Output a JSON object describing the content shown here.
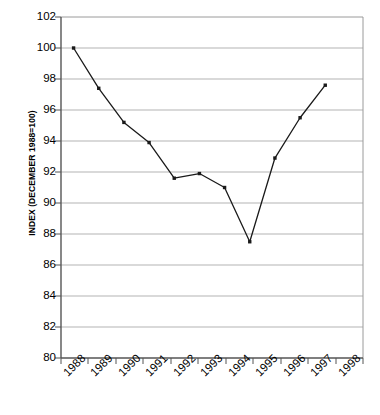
{
  "chart_data": {
    "type": "line",
    "title": "",
    "xlabel": "",
    "ylabel": "INDEX (DECEMBER 1988=100)",
    "categories": [
      "1988",
      "1989",
      "1990",
      "1991",
      "1992",
      "1993",
      "1994",
      "1995",
      "1996",
      "1997",
      "1998"
    ],
    "values": [
      100.0,
      97.4,
      95.2,
      93.9,
      91.6,
      91.9,
      91.0,
      87.5,
      92.9,
      95.5,
      97.6
    ],
    "series": [
      {
        "name": "Index",
        "values": [
          100.0,
          97.4,
          95.2,
          93.9,
          91.6,
          91.9,
          91.0,
          87.5,
          92.9,
          95.5,
          97.6
        ]
      }
    ],
    "ylim": [
      80,
      102
    ],
    "ytick_labels": [
      "80",
      "82",
      "84",
      "86",
      "88",
      "90",
      "92",
      "94",
      "96",
      "98",
      "100",
      "102"
    ],
    "ytick_values": [
      80,
      82,
      84,
      86,
      88,
      90,
      92,
      94,
      96,
      98,
      100,
      102
    ],
    "xtick_labels": [
      "1988",
      "1989",
      "1990",
      "1991",
      "1992",
      "1993",
      "1994",
      "1995",
      "1996",
      "1997",
      "1998"
    ],
    "grid": "horizontal",
    "legend": "none",
    "marker": "square",
    "line_color": "#1a1a1a",
    "grid_color": "#b3b3b3",
    "axis_color": "#808080",
    "background": "#ffffff"
  }
}
